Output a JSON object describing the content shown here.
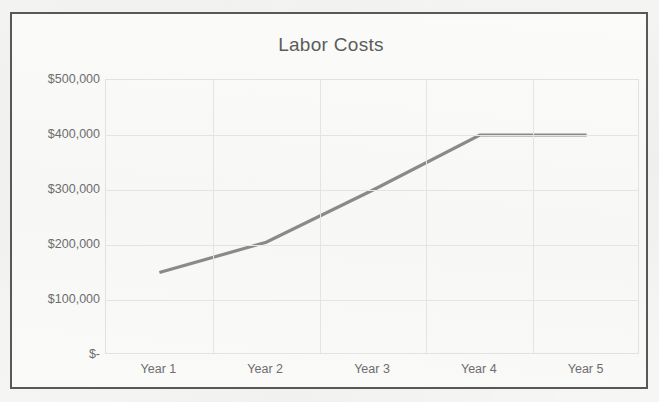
{
  "chart_data": {
    "type": "line",
    "title": "Labor Costs",
    "xlabel": "",
    "ylabel": "",
    "categories": [
      "Year 1",
      "Year 2",
      "Year 3",
      "Year 4",
      "Year 5"
    ],
    "series": [
      {
        "name": "Labor Costs",
        "values": [
          150000,
          205000,
          300000,
          400000,
          400000
        ],
        "color": "#8a8a8a"
      }
    ],
    "ylim": [
      0,
      500000
    ],
    "ytick_values": [
      0,
      100000,
      200000,
      300000,
      400000,
      500000
    ],
    "ytick_labels": [
      "$-",
      "$100,000",
      "$200,000",
      "$300,000",
      "$400,000",
      "$500,000"
    ],
    "grid": true,
    "legend": false,
    "legend_position": "none"
  },
  "style": {
    "line_color": "#8a8a8a",
    "gridline_color": "#e4e4e4",
    "axis_text_color": "#6d6d6d",
    "title_color": "#5c5c5c",
    "frame_border_color": "#585858",
    "plot_background": "#fafaf9"
  }
}
